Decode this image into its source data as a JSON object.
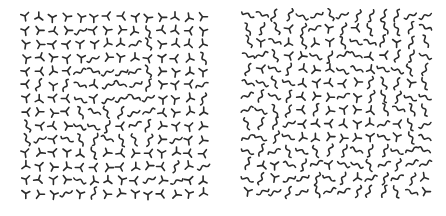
{
  "figure": {
    "background": "#ffffff",
    "mark_color": "#2b2b2b",
    "left_panel": {
      "grid": {
        "rows": 14,
        "cols": 14,
        "spacing": 13.6
      },
      "dominant_element": "tripod",
      "secondary_element": "wiggle",
      "note": "Mostly Y/T-shaped junction marks with a region of S-curve wiggles near the center"
    },
    "right_panel": {
      "grid": {
        "rows": 14,
        "cols": 14,
        "spacing": 13.6
      },
      "dominant_element": "wiggle",
      "secondary_element": "tripod",
      "note": "Mostly S-curve wiggle marks with a region of Y/T-shaped junctions in the center"
    }
  }
}
